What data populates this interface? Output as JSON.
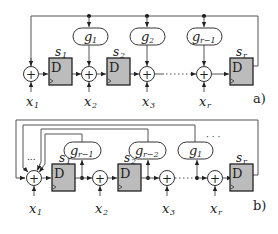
{
  "diagram_a": {
    "label": "a)",
    "g_blocks": [
      {
        "base": "g",
        "sub": "1"
      },
      {
        "base": "g",
        "sub": "2"
      },
      {
        "base": "g",
        "sub": "r−1"
      }
    ],
    "registers": [
      {
        "name": "s",
        "sub": "1",
        "content": "D"
      },
      {
        "name": "s",
        "sub": "2",
        "content": "D"
      },
      {
        "name": "s",
        "sub": "r",
        "content": "D"
      }
    ],
    "inputs": [
      {
        "base": "x",
        "sub": "1"
      },
      {
        "base": "x",
        "sub": "2"
      },
      {
        "base": "x",
        "sub": "3"
      },
      {
        "base": "x",
        "sub": "r"
      }
    ],
    "adder_symbol": "+",
    "ellipsis": "......"
  },
  "diagram_b": {
    "label": "b)",
    "g_blocks": [
      {
        "base": "g",
        "sub": "r−1"
      },
      {
        "base": "g",
        "sub": "r−2"
      },
      {
        "base": "g",
        "sub": "1"
      }
    ],
    "registers": [
      {
        "name": "s",
        "sub": "1",
        "content": "D"
      },
      {
        "name": "s",
        "sub": "2",
        "content": "D"
      },
      {
        "name": "s",
        "sub": "r",
        "content": "D"
      }
    ],
    "inputs": [
      {
        "base": "x",
        "sub": "1"
      },
      {
        "base": "x",
        "sub": "2"
      },
      {
        "base": "x",
        "sub": "3"
      },
      {
        "base": "x",
        "sub": "r"
      }
    ],
    "adder_symbol": "+",
    "feedback_ellipsis": "...",
    "top_ellipsis": "· · ·",
    "ellipsis": "......"
  }
}
